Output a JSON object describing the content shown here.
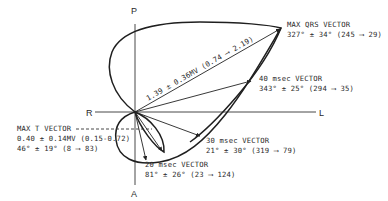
{
  "axes": {
    "top": "P",
    "bottom": "A",
    "left": "R",
    "right": "L"
  },
  "vectors": {
    "max_qrs": {
      "title": "MAX QRS VECTOR",
      "angle": "327° ± 34° (245 ⟶ 29)",
      "magnitude": "1.39 ± 0.36MV (0.74 ⟶ 2.19)"
    },
    "ms40": {
      "title": "40 msec VECTOR",
      "angle": "343° ± 25° (294 ⟶ 35)"
    },
    "ms30": {
      "title": "30 msec VECTOR",
      "angle": "21° ± 30° (319 ⟶ 79)"
    },
    "ms20": {
      "title": "20 msec VECTOR",
      "angle": "81° ± 26° (23 ⟶ 124)"
    },
    "max_t": {
      "title": "MAX T VECTOR",
      "magnitude": "0.40 ± 0.14MV (0.15-0.72)",
      "angle": "46° ± 19° (8 ⟶ 83)"
    }
  }
}
